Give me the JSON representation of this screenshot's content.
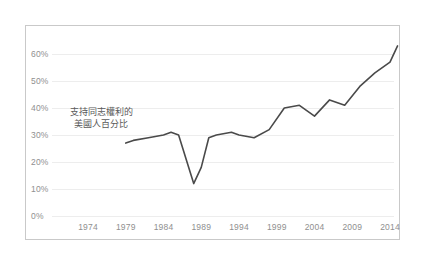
{
  "chart_data": {
    "type": "line",
    "title": "",
    "subtitle": "",
    "xlabel": "",
    "ylabel": "",
    "annotation": "支持同志權利的美國人百分比",
    "annotation_line1": "支持同志權利的",
    "annotation_line2": "美國人百分比",
    "series_color": "#4a4a4a",
    "grid": true,
    "grid_color": "#ededed",
    "frame_color": "#c9c9c9",
    "tick_color": "#8f8f8f",
    "legend": "none",
    "xlim": [
      1972,
      2016
    ],
    "ylim": [
      0,
      68
    ],
    "xticks": [
      1974,
      1979,
      1984,
      1989,
      1994,
      1999,
      2004,
      2009,
      2014
    ],
    "xtick_labels": [
      "1974",
      "1979",
      "1984",
      "1989",
      "1994",
      "1999",
      "2004",
      "2009",
      "2014"
    ],
    "yticks": [
      0,
      10,
      20,
      30,
      40,
      50,
      60
    ],
    "ytick_labels": [
      "0%",
      "10%",
      "20%",
      "30%",
      "40%",
      "50%",
      "60%"
    ],
    "series": [
      {
        "name": "支持同志權利的美國人百分比",
        "x": [
          1979,
          1980,
          1982,
          1984,
          1985,
          1986,
          1987,
          1988,
          1989,
          1990,
          1991,
          1993,
          1994,
          1996,
          1998,
          2000,
          2002,
          2004,
          2006,
          2008,
          2010,
          2012,
          2014,
          2015
        ],
        "values": [
          27,
          28,
          29,
          30,
          31,
          30,
          21,
          12,
          18,
          29,
          30,
          31,
          30,
          29,
          32,
          40,
          41,
          37,
          43,
          41,
          48,
          53,
          57,
          63
        ]
      }
    ]
  }
}
